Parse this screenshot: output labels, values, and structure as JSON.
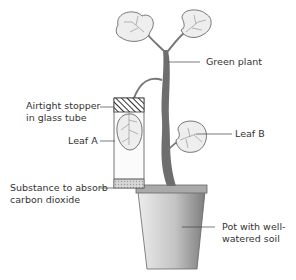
{
  "labels": {
    "green_plant": "Green plant",
    "stopper_line1": "Airtight stopper",
    "stopper_line2": "in glass tube",
    "leaf_a": "Leaf A",
    "leaf_b": "Leaf B",
    "substance_line1": "Substance to absorb",
    "substance_line2": "carbon dioxide",
    "pot_line1": "Pot with well-",
    "pot_line2": "watered soil"
  },
  "colors": {
    "stem": "#6e6e6e",
    "leaf_fill": "#eeeeee",
    "outline": "#555555",
    "pot_light": "#e6e6e6",
    "pot_dark": "#8a8a8a",
    "absorber": "#cfcfcf"
  }
}
